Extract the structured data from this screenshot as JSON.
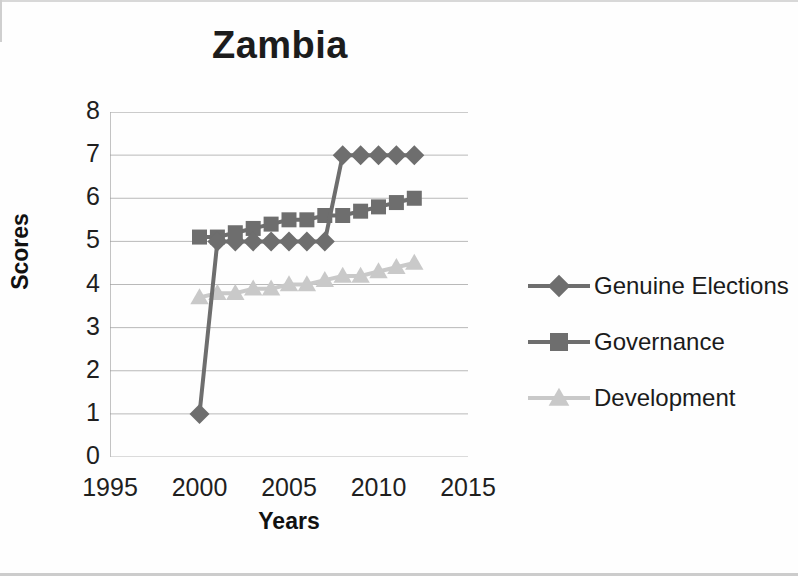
{
  "chart_data": {
    "type": "line",
    "title": "Zambia",
    "xlabel": "Years",
    "ylabel": "Scores",
    "xlim": [
      1995,
      2015
    ],
    "ylim": [
      0,
      8
    ],
    "xticks": [
      1995,
      2000,
      2005,
      2010,
      2015
    ],
    "yticks": [
      0,
      1,
      2,
      3,
      4,
      5,
      6,
      7,
      8
    ],
    "grid": true,
    "legend_position": "right",
    "x": [
      2000,
      2001,
      2002,
      2003,
      2004,
      2005,
      2006,
      2007,
      2008,
      2009,
      2010,
      2011,
      2012
    ],
    "series": [
      {
        "name": "Genuine Elections",
        "marker": "diamond",
        "color": "#6e6e6e",
        "values": [
          1,
          5,
          5,
          5,
          5,
          5,
          5,
          5,
          7,
          7,
          7,
          7,
          7
        ]
      },
      {
        "name": "Governance",
        "marker": "square",
        "color": "#6e6e6e",
        "values": [
          5.1,
          5.1,
          5.2,
          5.3,
          5.4,
          5.5,
          5.5,
          5.6,
          5.6,
          5.7,
          5.8,
          5.9,
          6.0
        ]
      },
      {
        "name": "Development",
        "marker": "triangle",
        "color": "#c9c9c9",
        "values": [
          3.7,
          3.8,
          3.8,
          3.9,
          3.9,
          4.0,
          4.0,
          4.1,
          4.2,
          4.2,
          4.3,
          4.4,
          4.5
        ]
      }
    ]
  },
  "title": {
    "text": "Zambia"
  },
  "axes": {
    "y_title": "Scores",
    "x_title": "Years",
    "y_tick_labels": [
      "8",
      "7",
      "6",
      "5",
      "4",
      "3",
      "2",
      "1",
      "0"
    ],
    "x_tick_labels": [
      "1995",
      "2000",
      "2005",
      "2010",
      "2015"
    ]
  },
  "legend": {
    "items": [
      {
        "label": "Genuine Elections",
        "marker": "diamond-marker-icon",
        "color": "#6e6e6e"
      },
      {
        "label": "Governance",
        "marker": "square-marker-icon",
        "color": "#6e6e6e"
      },
      {
        "label": "Development",
        "marker": "triangle-marker-icon",
        "color": "#c9c9c9"
      }
    ]
  }
}
